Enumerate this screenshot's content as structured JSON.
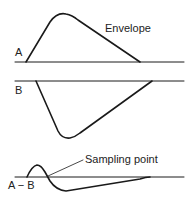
{
  "diagram": {
    "labels": {
      "envelope": "Envelope",
      "a": "A",
      "b": "B",
      "a_minus_b": "A − B",
      "sampling_point": "Sampling point"
    },
    "colors": {
      "stroke": "#1a1a1a",
      "background": "#ffffff"
    }
  }
}
